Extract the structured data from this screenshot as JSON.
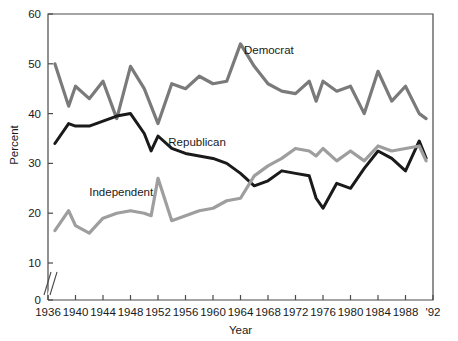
{
  "chart_data": {
    "type": "line",
    "title": "",
    "xlabel": "Year",
    "ylabel": "Percent",
    "xlim": [
      1936,
      1992
    ],
    "ylim": [
      0,
      60
    ],
    "y_axis_break": true,
    "y_axis_break_note": "axis broken between 0 and 10",
    "grid": false,
    "legend_position": "inline-labels",
    "xticks": [
      "1936",
      "1940",
      "1944",
      "1948",
      "1952",
      "1956",
      "1960",
      "1964",
      "1968",
      "1972",
      "1976",
      "1980",
      "1984",
      "1988",
      "'92"
    ],
    "xtick_values": [
      1936,
      1940,
      1944,
      1948,
      1952,
      1956,
      1960,
      1964,
      1968,
      1972,
      1976,
      1980,
      1984,
      1988,
      1992
    ],
    "yticks": [
      "0",
      "10",
      "20",
      "30",
      "40",
      "50",
      "60"
    ],
    "ytick_values": [
      0,
      10,
      20,
      30,
      40,
      50,
      60
    ],
    "x": [
      1937,
      1939,
      1940,
      1942,
      1944,
      1946,
      1948,
      1950,
      1951,
      1952,
      1954,
      1956,
      1958,
      1960,
      1962,
      1964,
      1966,
      1968,
      1970,
      1972,
      1974,
      1975,
      1976,
      1978,
      1980,
      1982,
      1984,
      1986,
      1988,
      1990,
      1991
    ],
    "series": [
      {
        "name": "Democrat",
        "color": "#7a7a7a",
        "values": [
          50.0,
          41.5,
          45.5,
          43.0,
          46.5,
          39.0,
          49.5,
          45.0,
          41.5,
          38.0,
          46.0,
          45.0,
          47.5,
          46.0,
          46.5,
          54.0,
          49.5,
          46.0,
          44.5,
          44.0,
          46.5,
          42.5,
          46.5,
          44.5,
          45.5,
          40.0,
          48.5,
          42.5,
          45.5,
          40.0,
          39.0
        ]
      },
      {
        "name": "Republican",
        "color": "#1a1a1a",
        "values": [
          34.0,
          38.0,
          37.5,
          37.5,
          38.5,
          39.5,
          40.0,
          36.0,
          32.5,
          35.5,
          33.0,
          32.0,
          31.5,
          31.0,
          30.0,
          28.0,
          25.5,
          26.5,
          28.5,
          28.0,
          27.5,
          23.0,
          21.0,
          26.0,
          25.0,
          29.0,
          32.5,
          31.0,
          28.5,
          34.5,
          31.0
        ]
      },
      {
        "name": "Independent",
        "color": "#9e9e9e",
        "values": [
          16.5,
          20.5,
          17.5,
          16.0,
          19.0,
          20.0,
          20.5,
          20.0,
          19.5,
          27.0,
          18.5,
          19.5,
          20.5,
          21.0,
          22.5,
          23.0,
          27.5,
          29.5,
          31.0,
          33.0,
          32.5,
          31.5,
          33.0,
          30.5,
          32.5,
          30.5,
          33.5,
          32.5,
          33.0,
          33.5,
          30.5
        ]
      }
    ],
    "annotations": [
      {
        "text": "Democrat",
        "x": 1964.5,
        "y": 52.0,
        "name": "democrat-series-label"
      },
      {
        "text": "Republican",
        "x": 1953.5,
        "y": 33.5,
        "name": "republican-series-label"
      },
      {
        "text": "Independent",
        "x": 1942.0,
        "y": 23.5,
        "name": "independent-series-label"
      }
    ]
  }
}
